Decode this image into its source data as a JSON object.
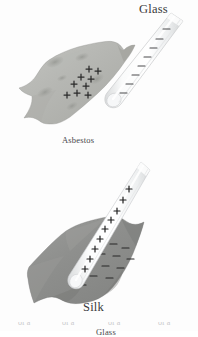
{
  "figure": {
    "background_color": "#fdfdfd",
    "panels": [
      {
        "id": "asbestos",
        "material_label": "Asbestos",
        "rod_label": "Glass",
        "rod_charge_sign": "−",
        "sheet_charge_sign": "+",
        "sheet_color": "#b7b8b4",
        "sheet_shadow_color": "#9a9b96",
        "rod_color": "#f2f3f4",
        "rod_edge_color": "#cfd1d2",
        "charge_color": "#2b2b2b",
        "rod_charge_count": 8,
        "sheet_charge_count": 9
      },
      {
        "id": "silk",
        "material_label": "Silk",
        "rod_label": "Glass",
        "rod_charge_sign": "+",
        "sheet_charge_sign": "−",
        "sheet_color": "#919290",
        "sheet_shadow_color": "#797a78",
        "rod_color": "#f4f5f6",
        "rod_edge_color": "#d2d4d5",
        "charge_color": "#1e1e1e",
        "rod_charge_count": 9,
        "sheet_charge_count": 12
      }
    ]
  },
  "labels": {
    "glass_top": "Glass",
    "asbestos": "Asbestos",
    "glass_bottom": "Glass",
    "silk": "Silk",
    "bottom_artifact": "of a"
  },
  "colors": {
    "page_background": "#fdfdfd",
    "text": "#3a3a3a",
    "asbestos_sheet": "#b7b8b4",
    "silk_sheet": "#919290",
    "glass_rod": "#f2f3f4",
    "charge_mark": "#2b2b2b"
  }
}
